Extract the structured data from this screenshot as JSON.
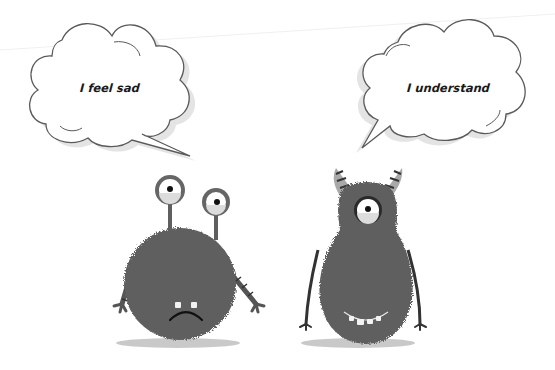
{
  "scene": {
    "description": "Two fuzzy gray cartoon monsters with speech bubbles",
    "background_color": "#ffffff",
    "fur_color": "#5f5f5f",
    "shadow_color": "#c8c8c8",
    "bubble_stroke": "#555555"
  },
  "bubbles": [
    {
      "id": "left",
      "speaker": "sad-monster",
      "text": "I feel sad"
    },
    {
      "id": "right",
      "speaker": "cyclops-monster",
      "text": "I understand"
    }
  ],
  "monsters": [
    {
      "id": "sad-monster",
      "eyes": 2,
      "eye_type": "stalk",
      "expression": "frown",
      "teeth": 2
    },
    {
      "id": "cyclops-monster",
      "eyes": 1,
      "horns": 2,
      "expression": "smile",
      "teeth": 4
    }
  ]
}
